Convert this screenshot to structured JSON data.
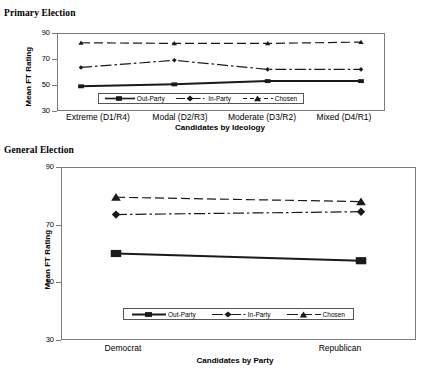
{
  "figure": {
    "panel1_label": "Primary Election",
    "panel2_label": "General Election"
  },
  "chart_data": [
    {
      "type": "line",
      "title": "Primary Election",
      "xlabel": "Candidates by Ideology",
      "ylabel": "Mean FT Rating",
      "ylim": [
        30,
        90
      ],
      "yticks": [
        30,
        50,
        70,
        90
      ],
      "grid": false,
      "legend_position": "inside-bottom-center",
      "categories": [
        "Extreme (D1/R4)",
        "Modal (D2/R3)",
        "Moderate (D3/R2)",
        "Mixed (D4/R1)"
      ],
      "series": [
        {
          "name": "Out-Party",
          "marker": "square",
          "linestyle": "solid",
          "values": [
            49,
            50.5,
            53,
            53
          ]
        },
        {
          "name": "In-Party",
          "marker": "diamond",
          "linestyle": "dash-dot",
          "values": [
            63.5,
            69,
            62,
            62
          ]
        },
        {
          "name": "Chosen",
          "marker": "triangle",
          "linestyle": "dashed",
          "values": [
            82.5,
            82,
            82,
            83
          ]
        }
      ]
    },
    {
      "type": "line",
      "title": "General Election",
      "xlabel": "Candidates by Party",
      "ylabel": "Mean FT Rating",
      "ylim": [
        30,
        90
      ],
      "yticks": [
        30,
        50,
        70,
        90
      ],
      "grid": false,
      "legend_position": "inside-bottom-center",
      "categories": [
        "Democrat",
        "Republican"
      ],
      "series": [
        {
          "name": "Out-Party",
          "marker": "square",
          "linestyle": "solid",
          "values": [
            60,
            57.5
          ]
        },
        {
          "name": "In-Party",
          "marker": "diamond",
          "linestyle": "dash-dot",
          "values": [
            73.5,
            74.5
          ]
        },
        {
          "name": "Chosen",
          "marker": "triangle",
          "linestyle": "dashed",
          "values": [
            79.5,
            78
          ]
        }
      ]
    }
  ],
  "legend": {
    "out_party": "Out-Party",
    "in_party": "In-Party",
    "chosen": "Chosen"
  },
  "primary": {
    "yticks": [
      "90",
      "70",
      "50",
      "30"
    ],
    "categories": [
      "Extreme (D1/R4)",
      "Modal (D2/R3)",
      "Moderate (D3/R2)",
      "Mixed (D4/R1)"
    ],
    "xlabel": "Candidates by Ideology",
    "ylabel": "Mean FT Rating"
  },
  "general": {
    "yticks": [
      "90",
      "70",
      "50",
      "30"
    ],
    "categories": [
      "Democrat",
      "Republican"
    ],
    "xlabel": "Candidates by Party",
    "ylabel": "Mean FT Rating"
  },
  "colors": {
    "line": "#1a1a1a",
    "frame": "#7a7a7a",
    "background": "#ffffff"
  }
}
